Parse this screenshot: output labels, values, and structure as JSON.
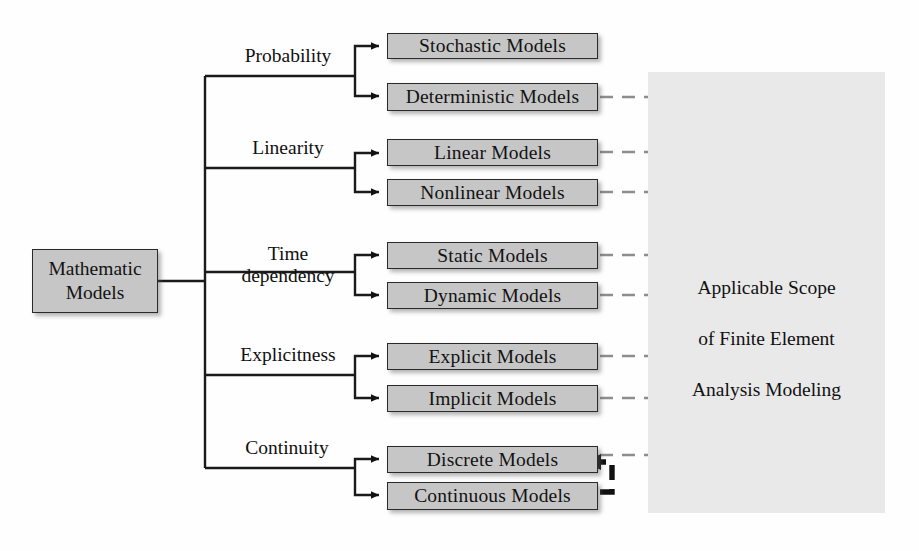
{
  "diagram": {
    "root": {
      "line1": "Mathematic",
      "line2": "Models"
    },
    "branches": [
      {
        "label": "Probability",
        "label_display": "Probability"
      },
      {
        "label": "Linearity",
        "label_display": "Linearity"
      },
      {
        "label": "Time dependency",
        "label_display": "Time\ndependency"
      },
      {
        "label": "Explicitness",
        "label_display": "Explicitness"
      },
      {
        "label": "Continuity",
        "label_display": "Continuity"
      }
    ],
    "leaves": [
      {
        "label": "Stochastic Models",
        "in_scope": false
      },
      {
        "label": "Deterministic Models",
        "in_scope": true
      },
      {
        "label": "Linear Models",
        "in_scope": true
      },
      {
        "label": "Nonlinear Models",
        "in_scope": true
      },
      {
        "label": "Static Models",
        "in_scope": true
      },
      {
        "label": "Dynamic Models",
        "in_scope": true
      },
      {
        "label": "Explicit Models",
        "in_scope": true
      },
      {
        "label": "Implicit Models",
        "in_scope": true
      },
      {
        "label": "Discrete Models",
        "in_scope": true
      },
      {
        "label": "Continuous Models",
        "in_scope": false
      }
    ],
    "scope": {
      "caption": "Applicable Scope\nof Finite Element\nAnalysis Modeling",
      "caption_line1": "Applicable Scope",
      "caption_line2": "of Finite Element",
      "caption_line3": "Analysis Modeling"
    },
    "colors": {
      "box_fill": "#c6c6c6",
      "box_border": "#2a2a2a",
      "connector": "#1a1a1a",
      "dashed_connector": "#8a8a8a",
      "feedback_arrow": "#111111",
      "scope_region": "#e9e9e9",
      "background": "#fefefe"
    }
  }
}
